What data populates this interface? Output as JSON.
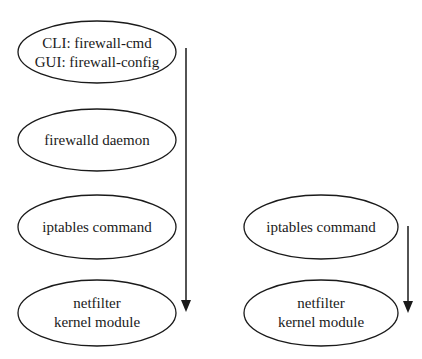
{
  "left_stack": {
    "nodes": [
      {
        "line1": "CLI: firewall-cmd",
        "line2": "GUI: firewall-config"
      },
      {
        "line1": "firewalld daemon"
      },
      {
        "line1": "iptables command"
      },
      {
        "line1": "netfilter",
        "line2": "kernel module"
      }
    ],
    "arrow": "down-arrow"
  },
  "right_stack": {
    "nodes": [
      {
        "line1": "iptables command"
      },
      {
        "line1": "netfilter",
        "line2": "kernel module"
      }
    ],
    "arrow": "down-arrow"
  },
  "colors": {
    "stroke": "#1a1a1a",
    "background": "#ffffff"
  }
}
